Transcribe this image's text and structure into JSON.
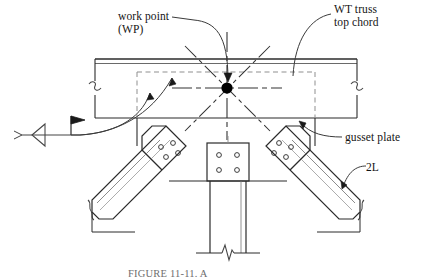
{
  "figure": {
    "domain_type": "engineering-detail-drawing",
    "caption": "FIGURE 11-11.  A"
  },
  "labels": {
    "work_point_line1": "work point",
    "work_point_line2": "(WP)",
    "wt_truss_line1": "WT truss",
    "wt_truss_line2": "top chord",
    "gusset_plate": "gusset plate",
    "double_angle": "2L"
  },
  "colors": {
    "line": "#2b2b2b",
    "line_light": "#555555",
    "hidden_line": "#8a8a8a",
    "center_line": "#3a3a3a",
    "work_point_fill": "#000000",
    "background": "#ffffff",
    "caption_text": "#6e6e6e"
  },
  "components": {
    "top_chord": {
      "name": "WT truss top chord",
      "flange_top_y": 59,
      "flange_bottom_y": 63,
      "web_bottom_y": 118,
      "left_x": 95,
      "right_x": 357,
      "break_symbols": 2
    },
    "gusset_plate": {
      "name": "gusset plate",
      "outline_style": "hidden-dashed",
      "left_x": 137,
      "right_x": 315,
      "top_y": 72,
      "bottom_y": 118
    },
    "work_point": {
      "name": "work point (WP)",
      "x": 227,
      "y": 88,
      "marker": "filled-circle",
      "radius": 5.5,
      "centerlines": [
        "horizontal",
        "vertical",
        "diagonal-up-left",
        "diagonal-up-right",
        "diagonal-down-left",
        "diagonal-down-right"
      ]
    },
    "left_diagonal_angle": {
      "name": "2L left diagonal web member",
      "bolt_holes": 4,
      "bolt_pattern": "diamond",
      "break_symbol": true
    },
    "right_diagonal_angle": {
      "name": "2L right diagonal web member",
      "bolt_holes": 4,
      "bolt_pattern": "diamond",
      "break_symbol": true
    },
    "vertical_member": {
      "name": "vertical column member",
      "bolt_holes": 4,
      "bolt_pattern": "2x2-rectangular",
      "break_symbol": true
    },
    "weld_symbol": {
      "name": "field fillet weld symbol",
      "elements": [
        "arrow-tail",
        "fillet-triangle",
        "reference-line",
        "field-weld-flag"
      ]
    }
  }
}
